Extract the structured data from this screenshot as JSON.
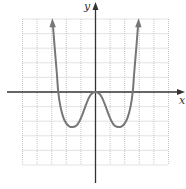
{
  "chart_data": {
    "type": "line",
    "title": "",
    "xlabel": "x",
    "ylabel": "y",
    "xlim": [
      -5,
      5
    ],
    "ylim": [
      -5,
      5
    ],
    "grid": true,
    "grid_step": 1,
    "grid_style": "dotted",
    "legend": null,
    "series": [
      {
        "name": "f(x)",
        "description": "Even function (W-shaped quartic) with local max at origin touching x-axis, two local minima, arrows at both ends indicating it continues upward",
        "x": [
          -2.95,
          -2.8,
          -2.65,
          -2.55,
          -2.4,
          -2.2,
          -2.0,
          -1.8,
          -1.55,
          -1.3,
          -1.1,
          -0.9,
          -0.7,
          -0.5,
          -0.3,
          0.0,
          0.3,
          0.5,
          0.7,
          0.9,
          1.1,
          1.3,
          1.55,
          1.8,
          2.0,
          2.2,
          2.4,
          2.55,
          2.65,
          2.8,
          2.95
        ],
        "y": [
          5.05,
          3.1,
          1.3,
          0.0,
          -1.0,
          -1.75,
          -2.15,
          -2.35,
          -2.4,
          -2.3,
          -2.0,
          -1.55,
          -1.0,
          -0.5,
          -0.15,
          0.0,
          -0.15,
          -0.5,
          -1.0,
          -1.55,
          -2.0,
          -2.3,
          -2.4,
          -2.35,
          -2.15,
          -1.75,
          -1.0,
          0.0,
          1.3,
          3.1,
          5.05
        ]
      }
    ],
    "key_points": {
      "local_max": [
        0,
        0
      ],
      "local_minima": [
        [
          -1.55,
          -2.4
        ],
        [
          1.55,
          -2.4
        ]
      ],
      "x_intercepts": [
        -2.55,
        0,
        2.55
      ]
    },
    "colors": {
      "curve": "#777777",
      "axes": "#333333",
      "grid": "#b8b8b8"
    }
  },
  "axes": {
    "x_label": "x",
    "y_label": "y"
  }
}
